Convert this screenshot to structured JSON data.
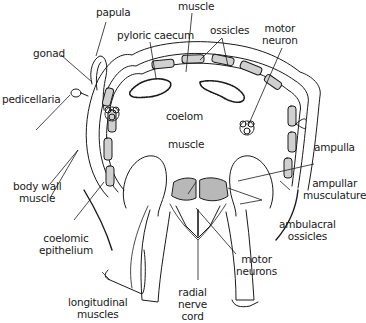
{
  "diagram": {
    "colors": {
      "line": "#1a1a1a",
      "ossicle_fill": "#d0d0d0",
      "muscle_fill": "#b8b8b8",
      "background": "#ffffff"
    },
    "labels": {
      "papula": "papula",
      "muscle_top": "muscle",
      "pyloric_caecum": "pyloric caecum",
      "ossicles": "ossicles",
      "motor_neuron_1": "motor",
      "motor_neuron_2": "neuron",
      "gonad": "gonad",
      "pedicellaria": "pedicellaria",
      "coelom": "coelom",
      "muscle_center": "muscle",
      "ampulla": "ampulla",
      "body_wall_muscle_1": "body wall",
      "body_wall_muscle_2": "muscle",
      "ampullar_musculature_1": "ampullar",
      "ampullar_musculature_2": "musculature",
      "coelomic_epithelium_1": "coelomic",
      "coelomic_epithelium_2": "epithelium",
      "ambulacral_ossicles_1": "ambulacral",
      "ambulacral_ossicles_2": "ossicles",
      "motor_neurons_1": "motor",
      "motor_neurons_2": "neurons",
      "radial_nerve_cord_1": "radial",
      "radial_nerve_cord_2": "nerve",
      "radial_nerve_cord_3": "cord",
      "longitudinal_muscles_1": "longitudinal",
      "longitudinal_muscles_2": "muscles"
    }
  }
}
